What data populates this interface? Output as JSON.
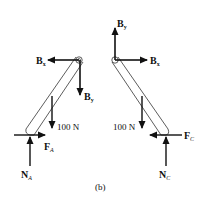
{
  "figure": {
    "caption": "(b)",
    "left_body": {
      "pin_labels": {
        "bx": "B",
        "bx_sub": "x",
        "by": "B",
        "by_sub": "y"
      },
      "weight_label": "100 N",
      "friction_label": "F",
      "friction_sub": "A",
      "normal_label": "N",
      "normal_sub": "A"
    },
    "right_body": {
      "pin_labels": {
        "bx": "B",
        "bx_sub": "x",
        "by": "B",
        "by_sub": "y"
      },
      "weight_label": "100 N",
      "friction_label": "F",
      "friction_sub": "C",
      "normal_label": "N",
      "normal_sub": "C"
    }
  }
}
